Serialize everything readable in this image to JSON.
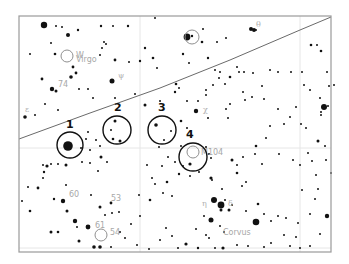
{
  "chart": {
    "frame": {
      "x": 19,
      "y": 16,
      "w": 312,
      "h": 236,
      "stroke": "#9a9a9a"
    },
    "ecliptic": {
      "points": [
        [
          19,
          139
        ],
        [
          90,
          113
        ],
        [
          160,
          88
        ],
        [
          230,
          60
        ],
        [
          300,
          30
        ],
        [
          331,
          17
        ]
      ],
      "color": "#6a6a6a"
    },
    "grid_lines": [
      {
        "x1": 140,
        "y1": 16,
        "x2": 140,
        "y2": 252
      },
      {
        "x1": 300,
        "y1": 16,
        "x2": 300,
        "y2": 252
      },
      {
        "x1": 19,
        "y1": 148,
        "x2": 331,
        "y2": 148
      },
      {
        "x1": 19,
        "y1": 248,
        "x2": 331,
        "y2": 248
      }
    ],
    "targets": [
      {
        "number": "1",
        "cx": 70,
        "cy": 145,
        "r": 13,
        "label_x": 66,
        "label_y": 128
      },
      {
        "number": "2",
        "cx": 117,
        "cy": 130,
        "r": 14,
        "label_x": 114,
        "label_y": 111
      },
      {
        "number": "3",
        "cx": 162,
        "cy": 130,
        "r": 14,
        "label_x": 158,
        "label_y": 111
      },
      {
        "number": "4",
        "cx": 193,
        "cy": 157,
        "r": 14,
        "label_x": 186,
        "label_y": 138
      }
    ],
    "deep_sky": [
      {
        "name": "M104",
        "cx": 193,
        "cy": 152,
        "r": 6,
        "label_x": 201,
        "label_y": 155
      },
      {
        "name": "W",
        "cx": 67,
        "cy": 56,
        "r": 6,
        "label_x": 76,
        "label_y": 58
      },
      {
        "name": "",
        "cx": 101,
        "cy": 235,
        "r": 6,
        "label_x": 0,
        "label_y": 0
      },
      {
        "name": "",
        "cx": 192,
        "cy": 37,
        "r": 7,
        "label_x": 0,
        "label_y": 0
      }
    ],
    "labels": [
      {
        "text": "Virgo",
        "x": 76,
        "y": 62,
        "cls": "lbl-grey"
      },
      {
        "text": "74",
        "x": 58,
        "y": 87,
        "cls": "lbl-grey"
      },
      {
        "text": "60",
        "x": 69,
        "y": 197,
        "cls": "lbl-grey"
      },
      {
        "text": "53",
        "x": 111,
        "y": 201,
        "cls": "lbl-grey"
      },
      {
        "text": "61",
        "x": 95,
        "y": 228,
        "cls": "lbl-grey"
      },
      {
        "text": "54",
        "x": 110,
        "y": 235,
        "cls": "lbl-grey"
      },
      {
        "text": "Corvus",
        "x": 223,
        "y": 235,
        "cls": "lbl-grey"
      },
      {
        "text": "ψ",
        "x": 118,
        "y": 78,
        "cls": "lbl-greek"
      },
      {
        "text": "χ",
        "x": 203,
        "y": 112,
        "cls": "lbl-greek"
      },
      {
        "text": "η",
        "x": 202,
        "y": 206,
        "cls": "lbl-greek"
      },
      {
        "text": "δ",
        "x": 228,
        "y": 206,
        "cls": "lbl-greek"
      },
      {
        "text": "θ",
        "x": 256,
        "y": 27,
        "cls": "lbl-greek"
      },
      {
        "text": "ε",
        "x": 25,
        "y": 112,
        "cls": "lbl-greek"
      }
    ],
    "stars": [
      [
        44,
        25,
        3.2
      ],
      [
        56,
        26,
        1
      ],
      [
        62,
        27,
        1
      ],
      [
        68,
        35,
        2
      ],
      [
        78,
        30,
        1.2
      ],
      [
        101,
        26,
        1.2
      ],
      [
        113,
        26,
        1
      ],
      [
        128,
        26,
        1.2
      ],
      [
        155,
        18,
        1
      ],
      [
        51,
        43,
        1
      ],
      [
        55,
        54,
        1.3
      ],
      [
        30,
        54,
        1
      ],
      [
        73,
        67,
        1.4
      ],
      [
        76,
        73,
        1.4
      ],
      [
        71,
        77,
        1.8
      ],
      [
        42,
        79,
        1.4
      ],
      [
        52,
        89,
        2.2
      ],
      [
        56,
        91,
        1.5
      ],
      [
        79,
        89,
        1
      ],
      [
        88,
        89,
        1
      ],
      [
        112,
        81,
        2.5
      ],
      [
        115,
        60,
        1.4
      ],
      [
        140,
        61,
        1.2
      ],
      [
        129,
        62,
        1
      ],
      [
        104,
        42,
        1
      ],
      [
        106,
        44,
        1
      ],
      [
        102,
        48,
        1
      ],
      [
        145,
        48,
        1.2
      ],
      [
        153,
        58,
        1.3
      ],
      [
        157,
        68,
        1
      ],
      [
        100,
        55,
        1
      ],
      [
        135,
        94,
        1
      ],
      [
        25,
        117,
        1.8
      ],
      [
        35,
        115,
        1
      ],
      [
        45,
        104,
        1
      ],
      [
        58,
        110,
        1
      ],
      [
        93,
        98,
        1
      ],
      [
        115,
        98,
        1
      ],
      [
        145,
        105,
        1.5
      ],
      [
        160,
        101,
        1
      ],
      [
        175,
        92,
        1.2
      ],
      [
        187,
        37,
        3.4
      ],
      [
        192,
        36,
        1.2
      ],
      [
        203,
        29,
        1
      ],
      [
        251,
        29,
        2
      ],
      [
        254,
        30,
        2
      ],
      [
        256,
        30,
        1
      ],
      [
        217,
        42,
        1
      ],
      [
        226,
        38,
        1
      ],
      [
        202,
        42,
        1.3
      ],
      [
        183,
        54,
        1.2
      ],
      [
        189,
        63,
        1
      ],
      [
        208,
        58,
        1.2
      ],
      [
        215,
        70,
        1
      ],
      [
        237,
        67,
        1
      ],
      [
        239,
        72,
        1
      ],
      [
        270,
        70,
        1
      ],
      [
        278,
        72,
        1
      ],
      [
        291,
        72,
        1
      ],
      [
        302,
        72,
        1
      ],
      [
        311,
        45,
        1.3
      ],
      [
        317,
        45,
        1
      ],
      [
        321,
        51,
        1.3
      ],
      [
        327,
        72,
        1
      ],
      [
        304,
        85,
        1
      ],
      [
        310,
        90,
        1
      ],
      [
        320,
        98,
        1
      ],
      [
        328,
        106,
        1
      ],
      [
        321,
        115,
        1
      ],
      [
        329,
        86,
        1
      ],
      [
        334,
        85,
        1
      ],
      [
        220,
        72,
        1
      ],
      [
        244,
        72,
        1
      ],
      [
        253,
        73,
        1
      ],
      [
        230,
        77,
        1.3
      ],
      [
        225,
        84,
        1
      ],
      [
        219,
        78,
        1
      ],
      [
        262,
        86,
        1
      ],
      [
        252,
        97,
        1
      ],
      [
        264,
        99,
        1
      ],
      [
        176,
        84,
        1.3
      ],
      [
        179,
        88,
        1
      ],
      [
        206,
        90,
        1
      ],
      [
        213,
        85,
        1
      ],
      [
        206,
        95,
        1
      ],
      [
        198,
        101,
        1
      ],
      [
        187,
        101,
        1
      ],
      [
        243,
        92,
        1
      ],
      [
        245,
        100,
        1
      ],
      [
        230,
        104,
        1
      ],
      [
        226,
        109,
        1
      ],
      [
        278,
        109,
        1
      ],
      [
        290,
        117,
        1
      ],
      [
        296,
        107,
        1
      ],
      [
        321,
        112,
        1
      ],
      [
        196,
        111,
        2.2
      ],
      [
        181,
        121,
        1.3
      ],
      [
        187,
        128,
        1
      ],
      [
        171,
        131,
        1
      ],
      [
        208,
        118,
        1
      ],
      [
        228,
        118,
        1
      ],
      [
        270,
        126,
        1
      ],
      [
        284,
        124,
        1
      ],
      [
        301,
        124,
        1
      ],
      [
        306,
        128,
        1
      ],
      [
        266,
        138,
        1
      ],
      [
        256,
        146,
        1.3
      ],
      [
        324,
        107,
        3
      ],
      [
        68,
        146,
        4.8
      ],
      [
        66,
        165,
        1.5
      ],
      [
        58,
        164,
        1
      ],
      [
        51,
        164,
        1
      ],
      [
        43,
        165,
        1
      ],
      [
        82,
        162,
        1
      ],
      [
        90,
        163,
        1
      ],
      [
        81,
        148,
        1
      ],
      [
        90,
        150,
        1
      ],
      [
        86,
        139,
        1
      ],
      [
        88,
        132,
        1
      ],
      [
        96,
        140,
        1
      ],
      [
        100,
        146,
        1
      ],
      [
        101,
        157,
        1.5
      ],
      [
        107,
        162,
        1
      ],
      [
        98,
        171,
        1
      ],
      [
        115,
        121,
        1.5
      ],
      [
        111,
        130,
        1
      ],
      [
        113,
        139,
        1.3
      ],
      [
        120,
        141,
        1.5
      ],
      [
        156,
        125,
        1.8
      ],
      [
        164,
        140,
        1
      ],
      [
        159,
        147,
        1
      ],
      [
        168,
        157,
        1
      ],
      [
        181,
        146,
        1
      ],
      [
        175,
        162,
        1
      ],
      [
        183,
        166,
        1
      ],
      [
        190,
        164,
        1.6
      ],
      [
        206,
        147,
        1
      ],
      [
        209,
        154,
        1
      ],
      [
        211,
        158,
        1
      ],
      [
        179,
        174,
        1.2
      ],
      [
        167,
        182,
        1.3
      ],
      [
        190,
        176,
        1
      ],
      [
        47,
        166,
        1.6
      ],
      [
        44,
        172,
        1.2
      ],
      [
        43,
        178,
        1
      ],
      [
        38,
        188,
        1.4
      ],
      [
        28,
        187,
        1
      ],
      [
        22,
        201,
        1
      ],
      [
        54,
        199,
        1.2
      ],
      [
        63,
        201,
        2.2
      ],
      [
        67,
        211,
        1.5
      ],
      [
        75,
        221,
        2.2
      ],
      [
        88,
        227,
        2.4
      ],
      [
        77,
        227,
        1
      ],
      [
        100,
        207,
        1.5
      ],
      [
        111,
        203,
        1.4
      ],
      [
        112,
        213,
        1
      ],
      [
        105,
        215,
        1
      ],
      [
        119,
        212,
        1
      ],
      [
        91,
        195,
        1
      ],
      [
        66,
        185,
        1
      ],
      [
        30,
        211,
        1.3
      ],
      [
        51,
        232,
        1.5
      ],
      [
        58,
        232,
        1.3
      ],
      [
        79,
        241,
        1.5
      ],
      [
        94,
        247,
        1.8
      ],
      [
        100,
        247,
        1.8
      ],
      [
        111,
        247,
        1
      ],
      [
        120,
        232,
        1
      ],
      [
        131,
        224,
        1
      ],
      [
        140,
        216,
        1
      ],
      [
        139,
        195,
        1
      ],
      [
        150,
        200,
        1.3
      ],
      [
        155,
        184,
        1
      ],
      [
        163,
        193,
        1
      ],
      [
        172,
        196,
        1
      ],
      [
        152,
        178,
        1
      ],
      [
        147,
        165,
        1
      ],
      [
        162,
        166,
        1
      ],
      [
        199,
        172,
        1
      ],
      [
        211,
        178,
        1.6
      ],
      [
        212,
        180,
        1
      ],
      [
        222,
        189,
        1
      ],
      [
        225,
        200,
        1
      ],
      [
        237,
        173,
        1.3
      ],
      [
        246,
        182,
        1
      ],
      [
        242,
        186,
        1
      ],
      [
        232,
        160,
        1.5
      ],
      [
        237,
        165,
        1
      ],
      [
        243,
        157,
        1
      ],
      [
        255,
        154,
        1
      ],
      [
        262,
        164,
        1
      ],
      [
        279,
        154,
        1
      ],
      [
        293,
        160,
        1
      ],
      [
        300,
        165,
        1
      ],
      [
        211,
        220,
        2.5
      ],
      [
        221,
        210,
        1.5
      ],
      [
        232,
        205,
        1
      ],
      [
        220,
        226,
        1
      ],
      [
        224,
        232,
        1
      ],
      [
        206,
        235,
        1
      ],
      [
        204,
        216,
        1
      ],
      [
        196,
        229,
        1
      ],
      [
        214,
        200,
        3
      ],
      [
        221,
        205,
        3.4
      ],
      [
        229,
        210,
        1.5
      ],
      [
        246,
        211,
        1
      ],
      [
        258,
        204,
        1.3
      ],
      [
        256,
        222,
        3.3
      ],
      [
        264,
        214,
        1
      ],
      [
        271,
        221,
        1
      ],
      [
        278,
        216,
        1
      ],
      [
        284,
        235,
        1
      ],
      [
        298,
        223,
        1
      ],
      [
        310,
        214,
        1
      ],
      [
        315,
        199,
        1
      ],
      [
        318,
        189,
        1
      ],
      [
        302,
        190,
        1
      ],
      [
        312,
        161,
        1
      ],
      [
        316,
        175,
        1
      ],
      [
        326,
        160,
        1
      ],
      [
        331,
        173,
        1
      ],
      [
        318,
        141,
        1.5
      ],
      [
        325,
        146,
        1
      ],
      [
        308,
        153,
        1
      ],
      [
        327,
        216,
        2.2
      ],
      [
        320,
        234,
        1
      ],
      [
        286,
        218,
        1
      ],
      [
        271,
        243,
        1
      ],
      [
        264,
        247,
        1
      ],
      [
        237,
        245,
        1
      ],
      [
        248,
        246,
        1
      ],
      [
        209,
        238,
        1
      ],
      [
        198,
        248,
        1.2
      ],
      [
        215,
        248,
        1
      ],
      [
        223,
        248,
        1.6
      ],
      [
        300,
        248,
        1
      ],
      [
        310,
        246,
        1
      ],
      [
        296,
        237,
        1
      ],
      [
        290,
        246,
        1
      ],
      [
        149,
        249,
        1
      ],
      [
        137,
        245,
        1
      ],
      [
        160,
        240,
        1
      ],
      [
        125,
        238,
        1
      ],
      [
        166,
        228,
        1
      ],
      [
        186,
        244,
        1.6
      ],
      [
        178,
        248,
        1
      ],
      [
        172,
        236,
        1
      ]
    ]
  }
}
